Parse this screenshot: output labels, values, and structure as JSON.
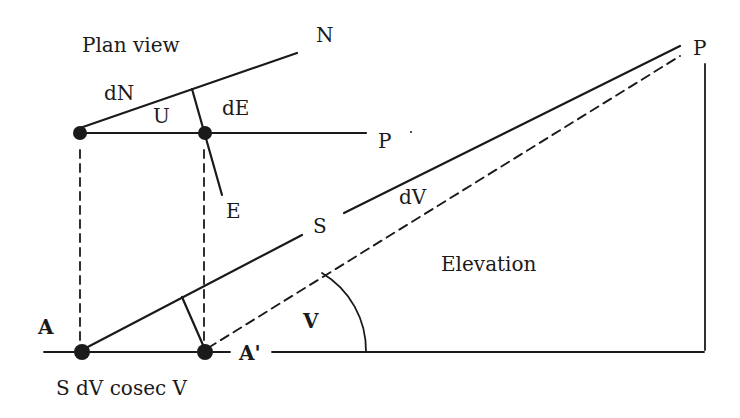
{
  "diagram": {
    "type": "surveying geometry: plan view and elevation of a sight line",
    "colors": {
      "ink": "#1a1a1a",
      "background": "#ffffff"
    },
    "plan_view": {
      "title": "Plan view",
      "labels": {
        "north": "N",
        "east": "E",
        "point": "P",
        "dN": "dN",
        "dE": "dE",
        "angle": "U"
      }
    },
    "elevation": {
      "title": "Elevation",
      "labels": {
        "station": "A",
        "station_prime": "A'",
        "slope_distance": "S",
        "vertical_error": "dV",
        "vertical_angle": "V",
        "target": "P",
        "offset_formula": "S dV cosec V"
      }
    }
  }
}
